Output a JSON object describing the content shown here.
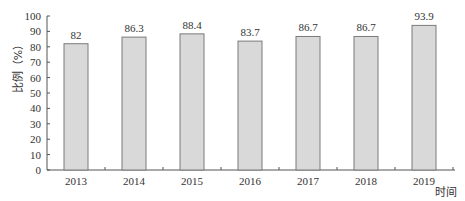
{
  "chart_data": {
    "type": "bar",
    "title": "",
    "xlabel": "时间",
    "ylabel": "比例（%）",
    "categories": [
      "2013",
      "2014",
      "2015",
      "2016",
      "2017",
      "2018",
      "2019"
    ],
    "values": [
      82,
      86.3,
      88.4,
      83.7,
      86.7,
      86.7,
      93.9
    ],
    "value_labels": [
      "82",
      "86.3",
      "88.4",
      "83.7",
      "86.7",
      "86.7",
      "93.9"
    ],
    "ylim": [
      0,
      100
    ],
    "yticks": [
      0,
      10,
      20,
      30,
      40,
      50,
      60,
      70,
      80,
      90,
      100
    ],
    "grid": false,
    "legend": null,
    "colors": {
      "bar_fill": "#d9d9d9",
      "bar_stroke": "#7a7a7a",
      "axis": "#555555"
    }
  }
}
